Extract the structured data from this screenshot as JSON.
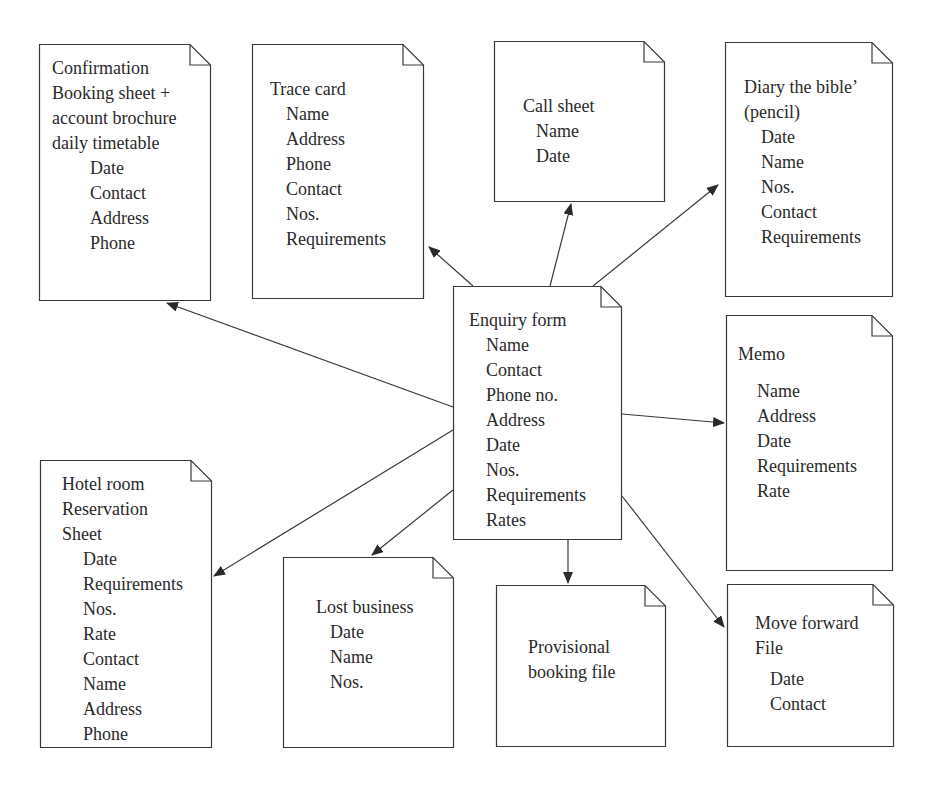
{
  "diagram": {
    "type": "document-flow",
    "center": "enquiry",
    "colors": {
      "stroke": "#3a3a3a",
      "text": "#2a2a2a",
      "background": "#ffffff"
    },
    "documents": {
      "confirmation": {
        "title": [
          "Confirmation",
          "Booking sheet +",
          "account brochure",
          "daily timetable"
        ],
        "fields": [
          "Date",
          "Contact",
          "Address",
          "Phone"
        ]
      },
      "trace_card": {
        "title": [
          "Trace card"
        ],
        "fields": [
          "Name",
          "Address",
          "Phone",
          "Contact",
          "Nos.",
          "Requirements"
        ]
      },
      "call_sheet": {
        "title": [
          "Call sheet"
        ],
        "fields": [
          "Name",
          "Date"
        ]
      },
      "diary": {
        "title": [
          "Diary the bible’",
          "(pencil)"
        ],
        "fields": [
          "Date",
          "Name",
          "Nos.",
          "Contact",
          "Requirements"
        ]
      },
      "enquiry": {
        "title": [
          "Enquiry form"
        ],
        "fields": [
          "Name",
          "Contact",
          "Phone no.",
          "Address",
          "Date",
          "Nos.",
          "Requirements",
          "Rates"
        ]
      },
      "memo": {
        "title": [
          "Memo"
        ],
        "fields": [
          "Name",
          "Address",
          "Date",
          "Requirements",
          "Rate"
        ]
      },
      "hotel_room": {
        "title": [
          "Hotel room",
          "Reservation",
          "Sheet"
        ],
        "fields": [
          "Date",
          "Requirements",
          "Nos.",
          "Rate",
          "Contact",
          "Name",
          "Address",
          "Phone"
        ]
      },
      "lost_business": {
        "title": [
          "Lost business"
        ],
        "fields": [
          "Date",
          "Name",
          "Nos."
        ]
      },
      "provisional": {
        "title": [
          "Provisional",
          "booking file"
        ],
        "fields": []
      },
      "move_forward": {
        "title": [
          "Move forward",
          "File"
        ],
        "fields": [
          "Date",
          "Contact"
        ]
      }
    },
    "edges": [
      {
        "from": "enquiry",
        "to": "confirmation"
      },
      {
        "from": "enquiry",
        "to": "trace_card"
      },
      {
        "from": "enquiry",
        "to": "call_sheet"
      },
      {
        "from": "enquiry",
        "to": "diary"
      },
      {
        "from": "enquiry",
        "to": "memo"
      },
      {
        "from": "enquiry",
        "to": "hotel_room"
      },
      {
        "from": "enquiry",
        "to": "lost_business"
      },
      {
        "from": "enquiry",
        "to": "provisional"
      },
      {
        "from": "enquiry",
        "to": "move_forward"
      }
    ]
  }
}
